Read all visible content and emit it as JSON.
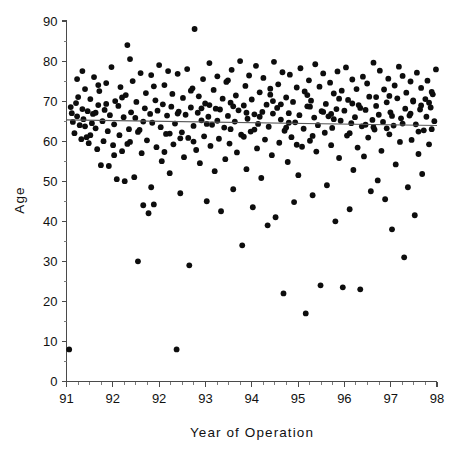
{
  "chart_data": {
    "type": "scatter",
    "title": "",
    "xlabel": "Year  of  Operation",
    "ylabel": "Age",
    "xlim": [
      91,
      98
    ],
    "ylim": [
      0,
      90
    ],
    "grid": false,
    "legend": null,
    "x_tick_labels": [
      "91",
      "92",
      "92",
      "93",
      "94",
      "95",
      "96",
      "97",
      "98"
    ],
    "x_tick_values": [
      91,
      91.875,
      92.75,
      93.625,
      94.5,
      95.375,
      96.25,
      97.125,
      98
    ],
    "y_tick_labels": [
      "0",
      "10",
      "20",
      "30",
      "40",
      "50",
      "60",
      "70",
      "80",
      "90"
    ],
    "y_tick_values": [
      0,
      10,
      20,
      30,
      40,
      50,
      60,
      70,
      80,
      90
    ],
    "x_minor_per_major": 4,
    "y_minor_per_major": 2,
    "marker": "filled-circle",
    "marker_color": "#0d0d0d",
    "marker_radius_px": 2.9,
    "trend_line": {
      "label": "regression-line",
      "color": "#5a5a5a",
      "x_start": 91.0,
      "y_start": 65.3,
      "x_end": 98.0,
      "y_end": 63.9
    },
    "points": [
      [
        91.05,
        8.0
      ],
      [
        91.08,
        68.5
      ],
      [
        91.1,
        67.0
      ],
      [
        91.12,
        64.8
      ],
      [
        91.15,
        62.0
      ],
      [
        91.18,
        69.5
      ],
      [
        91.2,
        66.2
      ],
      [
        91.22,
        71.0
      ],
      [
        91.25,
        64.0
      ],
      [
        91.28,
        60.5
      ],
      [
        91.3,
        68.0
      ],
      [
        91.32,
        65.5
      ],
      [
        91.35,
        73.0
      ],
      [
        91.38,
        61.0
      ],
      [
        91.4,
        67.5
      ],
      [
        91.42,
        59.5
      ],
      [
        91.45,
        70.5
      ],
      [
        91.48,
        64.5
      ],
      [
        91.5,
        66.8
      ],
      [
        91.52,
        76.0
      ],
      [
        91.55,
        63.2
      ],
      [
        91.58,
        58.0
      ],
      [
        91.6,
        69.0
      ],
      [
        91.62,
        72.5
      ],
      [
        91.65,
        54.0
      ],
      [
        91.68,
        65.0
      ],
      [
        91.7,
        60.0
      ],
      [
        91.72,
        67.8
      ],
      [
        91.75,
        74.5
      ],
      [
        91.78,
        62.5
      ],
      [
        91.8,
        53.8
      ],
      [
        91.82,
        66.5
      ],
      [
        91.85,
        78.5
      ],
      [
        91.88,
        59.0
      ],
      [
        91.9,
        64.2
      ],
      [
        91.92,
        70.0
      ],
      [
        91.95,
        50.5
      ],
      [
        91.98,
        68.8
      ],
      [
        92.0,
        61.5
      ],
      [
        92.02,
        73.5
      ],
      [
        92.05,
        57.5
      ],
      [
        92.08,
        66.0
      ],
      [
        92.1,
        50.0
      ],
      [
        92.12,
        71.5
      ],
      [
        92.15,
        84.0
      ],
      [
        92.18,
        63.0
      ],
      [
        92.2,
        59.8
      ],
      [
        92.22,
        67.2
      ],
      [
        92.25,
        75.0
      ],
      [
        92.28,
        51.0
      ],
      [
        92.3,
        65.8
      ],
      [
        92.32,
        69.8
      ],
      [
        92.35,
        30.0
      ],
      [
        92.38,
        62.8
      ],
      [
        92.4,
        77.0
      ],
      [
        92.42,
        57.0
      ],
      [
        92.45,
        44.0
      ],
      [
        92.48,
        68.2
      ],
      [
        92.5,
        72.0
      ],
      [
        92.52,
        60.2
      ],
      [
        92.55,
        42.0
      ],
      [
        92.58,
        66.8
      ],
      [
        92.6,
        76.5
      ],
      [
        92.62,
        64.6
      ],
      [
        92.65,
        44.2
      ],
      [
        92.68,
        70.2
      ],
      [
        92.7,
        58.5
      ],
      [
        92.72,
        67.6
      ],
      [
        92.75,
        79.0
      ],
      [
        92.78,
        63.5
      ],
      [
        92.8,
        55.0
      ],
      [
        92.82,
        69.2
      ],
      [
        92.85,
        74.0
      ],
      [
        92.88,
        61.8
      ],
      [
        92.9,
        66.4
      ],
      [
        92.92,
        77.5
      ],
      [
        92.95,
        52.0
      ],
      [
        92.98,
        68.6
      ],
      [
        93.0,
        71.8
      ],
      [
        93.02,
        59.2
      ],
      [
        93.05,
        64.4
      ],
      [
        93.08,
        8.0
      ],
      [
        93.1,
        76.8
      ],
      [
        93.12,
        67.4
      ],
      [
        93.15,
        47.0
      ],
      [
        93.18,
        62.2
      ],
      [
        93.2,
        70.8
      ],
      [
        93.22,
        56.0
      ],
      [
        93.25,
        66.6
      ],
      [
        93.28,
        78.0
      ],
      [
        93.3,
        60.8
      ],
      [
        93.32,
        29.0
      ],
      [
        93.35,
        68.4
      ],
      [
        93.38,
        73.2
      ],
      [
        93.4,
        63.8
      ],
      [
        93.42,
        88.0
      ],
      [
        93.45,
        57.8
      ],
      [
        93.48,
        67.1
      ],
      [
        93.5,
        71.2
      ],
      [
        93.52,
        54.5
      ],
      [
        93.55,
        65.2
      ],
      [
        93.58,
        75.5
      ],
      [
        93.6,
        61.2
      ],
      [
        93.62,
        69.4
      ],
      [
        93.65,
        45.0
      ],
      [
        93.68,
        66.1
      ],
      [
        93.7,
        79.5
      ],
      [
        93.72,
        58.8
      ],
      [
        93.75,
        64.1
      ],
      [
        93.78,
        72.8
      ],
      [
        93.8,
        52.5
      ],
      [
        93.82,
        68.1
      ],
      [
        93.85,
        76.2
      ],
      [
        93.88,
        60.6
      ],
      [
        93.9,
        67.9
      ],
      [
        93.92,
        42.5
      ],
      [
        93.95,
        70.6
      ],
      [
        93.98,
        63.4
      ],
      [
        94.0,
        55.5
      ],
      [
        94.02,
        74.8
      ],
      [
        94.05,
        66.3
      ],
      [
        94.08,
        59.4
      ],
      [
        94.1,
        69.6
      ],
      [
        94.12,
        77.8
      ],
      [
        94.15,
        48.0
      ],
      [
        94.18,
        64.9
      ],
      [
        94.2,
        71.4
      ],
      [
        94.22,
        57.2
      ],
      [
        94.25,
        67.7
      ],
      [
        94.28,
        80.0
      ],
      [
        94.3,
        61.6
      ],
      [
        94.32,
        34.0
      ],
      [
        94.35,
        68.9
      ],
      [
        94.38,
        73.8
      ],
      [
        94.4,
        53.0
      ],
      [
        94.42,
        65.6
      ],
      [
        94.45,
        76.4
      ],
      [
        94.48,
        62.4
      ],
      [
        94.5,
        70.4
      ],
      [
        94.52,
        43.5
      ],
      [
        94.55,
        66.7
      ],
      [
        94.58,
        78.8
      ],
      [
        94.6,
        58.2
      ],
      [
        94.62,
        64.3
      ],
      [
        94.65,
        72.2
      ],
      [
        94.68,
        50.8
      ],
      [
        94.7,
        67.3
      ],
      [
        94.72,
        75.8
      ],
      [
        94.75,
        60.4
      ],
      [
        94.78,
        69.1
      ],
      [
        94.8,
        39.0
      ],
      [
        94.82,
        63.6
      ],
      [
        94.85,
        71.6
      ],
      [
        94.88,
        56.5
      ],
      [
        94.9,
        66.9
      ],
      [
        94.92,
        79.8
      ],
      [
        94.95,
        41.0
      ],
      [
        94.98,
        68.3
      ],
      [
        95.0,
        74.2
      ],
      [
        95.02,
        59.6
      ],
      [
        95.05,
        65.4
      ],
      [
        95.08,
        77.2
      ],
      [
        95.1,
        22.0
      ],
      [
        95.12,
        62.6
      ],
      [
        95.15,
        70.9
      ],
      [
        95.18,
        54.8
      ],
      [
        95.2,
        67.0
      ],
      [
        95.22,
        76.6
      ],
      [
        95.25,
        61.0
      ],
      [
        95.28,
        69.8
      ],
      [
        95.3,
        44.8
      ],
      [
        95.32,
        64.7
      ],
      [
        95.35,
        73.4
      ],
      [
        95.38,
        51.5
      ],
      [
        95.4,
        66.5
      ],
      [
        95.42,
        78.2
      ],
      [
        95.45,
        58.6
      ],
      [
        95.48,
        63.1
      ],
      [
        95.5,
        72.4
      ],
      [
        95.52,
        17.0
      ],
      [
        95.55,
        68.7
      ],
      [
        95.58,
        75.2
      ],
      [
        95.6,
        60.1
      ],
      [
        95.62,
        70.1
      ],
      [
        95.65,
        46.5
      ],
      [
        95.68,
        65.9
      ],
      [
        95.7,
        79.2
      ],
      [
        95.72,
        57.4
      ],
      [
        95.75,
        64.0
      ],
      [
        95.78,
        73.6
      ],
      [
        95.8,
        24.0
      ],
      [
        95.82,
        67.5
      ],
      [
        95.85,
        76.9
      ],
      [
        95.88,
        62.1
      ],
      [
        95.9,
        69.3
      ],
      [
        95.92,
        49.0
      ],
      [
        95.95,
        66.2
      ],
      [
        95.98,
        74.6
      ],
      [
        96.0,
        59.0
      ],
      [
        96.02,
        63.3
      ],
      [
        96.05,
        71.9
      ],
      [
        96.08,
        40.0
      ],
      [
        96.1,
        68.0
      ],
      [
        96.12,
        77.4
      ],
      [
        96.15,
        55.8
      ],
      [
        96.18,
        65.1
      ],
      [
        96.2,
        72.6
      ],
      [
        96.22,
        23.5
      ],
      [
        96.25,
        67.6
      ],
      [
        96.28,
        78.4
      ],
      [
        96.3,
        61.4
      ],
      [
        96.32,
        70.3
      ],
      [
        96.35,
        43.0
      ],
      [
        96.38,
        64.5
      ],
      [
        96.4,
        75.4
      ],
      [
        96.42,
        52.8
      ],
      [
        96.45,
        66.0
      ],
      [
        96.48,
        73.0
      ],
      [
        96.5,
        58.4
      ],
      [
        96.52,
        69.0
      ],
      [
        96.55,
        23.0
      ],
      [
        96.58,
        63.7
      ],
      [
        96.6,
        76.1
      ],
      [
        96.62,
        56.2
      ],
      [
        96.65,
        67.8
      ],
      [
        96.68,
        74.4
      ],
      [
        96.7,
        60.9
      ],
      [
        96.72,
        71.1
      ],
      [
        96.75,
        47.5
      ],
      [
        96.78,
        65.3
      ],
      [
        96.8,
        79.6
      ],
      [
        96.82,
        62.9
      ],
      [
        96.85,
        68.8
      ],
      [
        96.88,
        50.2
      ],
      [
        96.9,
        66.6
      ],
      [
        96.92,
        77.6
      ],
      [
        96.95,
        57.6
      ],
      [
        96.98,
        64.8
      ],
      [
        97.0,
        72.9
      ],
      [
        97.02,
        45.5
      ],
      [
        97.05,
        69.7
      ],
      [
        97.08,
        75.6
      ],
      [
        97.1,
        61.7
      ],
      [
        97.12,
        67.2
      ],
      [
        97.15,
        38.0
      ],
      [
        97.18,
        63.9
      ],
      [
        97.2,
        73.9
      ],
      [
        97.22,
        54.2
      ],
      [
        97.25,
        70.7
      ],
      [
        97.28,
        78.6
      ],
      [
        97.3,
        59.8
      ],
      [
        97.32,
        65.7
      ],
      [
        97.35,
        76.3
      ],
      [
        97.38,
        31.0
      ],
      [
        97.4,
        68.1
      ],
      [
        97.42,
        72.1
      ],
      [
        97.45,
        48.5
      ],
      [
        97.48,
        66.4
      ],
      [
        97.5,
        74.9
      ],
      [
        97.52,
        60.3
      ],
      [
        97.55,
        69.9
      ],
      [
        97.58,
        41.5
      ],
      [
        97.6,
        64.2
      ],
      [
        97.62,
        77.1
      ],
      [
        97.65,
        56.8
      ],
      [
        97.68,
        67.9
      ],
      [
        97.7,
        73.3
      ],
      [
        97.72,
        51.8
      ],
      [
        97.75,
        62.7
      ],
      [
        97.78,
        70.5
      ],
      [
        97.8,
        66.1
      ],
      [
        97.82,
        75.1
      ],
      [
        97.85,
        59.2
      ],
      [
        97.88,
        68.4
      ],
      [
        97.9,
        63.0
      ],
      [
        97.92,
        71.7
      ],
      [
        97.95,
        65.0
      ],
      [
        97.98,
        77.9
      ],
      [
        91.3,
        77.5
      ],
      [
        91.6,
        74.0
      ],
      [
        91.9,
        56.5
      ],
      [
        92.2,
        80.5
      ],
      [
        92.6,
        48.5
      ],
      [
        93.1,
        66.9
      ],
      [
        93.4,
        59.9
      ],
      [
        93.7,
        69.0
      ],
      [
        94.1,
        63.0
      ],
      [
        94.4,
        67.1
      ],
      [
        94.9,
        70.0
      ],
      [
        95.2,
        64.6
      ],
      [
        95.6,
        68.6
      ],
      [
        96.0,
        66.8
      ],
      [
        96.4,
        69.4
      ],
      [
        96.8,
        63.5
      ],
      [
        97.1,
        71.3
      ],
      [
        97.5,
        66.9
      ],
      [
        97.7,
        68.9
      ],
      [
        97.9,
        72.3
      ],
      [
        91.45,
        61.5
      ],
      [
        91.75,
        69.3
      ],
      [
        92.35,
        62.3
      ],
      [
        92.85,
        57.3
      ],
      [
        93.35,
        72.6
      ],
      [
        93.85,
        65.1
      ],
      [
        94.35,
        61.1
      ],
      [
        94.85,
        73.1
      ],
      [
        95.35,
        59.1
      ],
      [
        95.85,
        67.3
      ],
      [
        96.35,
        62.0
      ],
      [
        96.85,
        71.0
      ],
      [
        97.35,
        64.4
      ],
      [
        97.85,
        69.6
      ],
      [
        91.2,
        75.5
      ],
      [
        91.55,
        67.1
      ],
      [
        92.05,
        70.9
      ],
      [
        92.45,
        64.9
      ],
      [
        92.95,
        61.9
      ],
      [
        93.55,
        68.2
      ],
      [
        94.05,
        75.2
      ],
      [
        94.55,
        62.9
      ],
      [
        95.05,
        69.2
      ],
      [
        95.55,
        71.5
      ],
      [
        96.05,
        65.5
      ],
      [
        96.55,
        68.3
      ],
      [
        97.05,
        63.2
      ],
      [
        97.55,
        70.2
      ],
      [
        91.35,
        63.7
      ],
      [
        92.15,
        59.3
      ],
      [
        92.65,
        73.7
      ],
      [
        93.15,
        60.7
      ],
      [
        93.65,
        64.3
      ],
      [
        94.15,
        68.7
      ],
      [
        94.65,
        66.1
      ],
      [
        95.15,
        63.4
      ],
      [
        95.65,
        61.3
      ],
      [
        96.15,
        70.6
      ],
      [
        96.65,
        64.1
      ],
      [
        97.15,
        66.3
      ],
      [
        97.65,
        62.4
      ]
    ]
  },
  "axis": {
    "y_label_text": "Age",
    "x_label_text": "Year  of  Operation"
  }
}
